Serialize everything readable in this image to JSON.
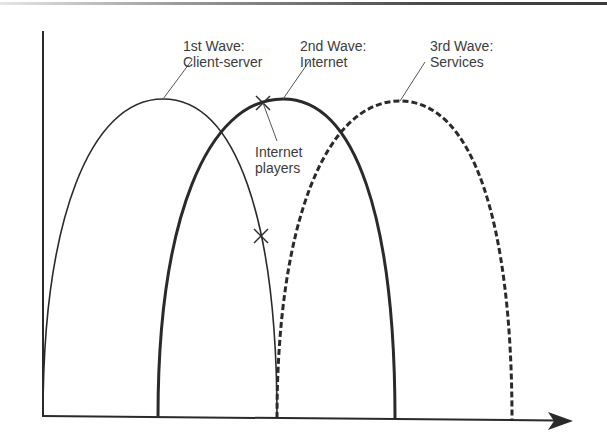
{
  "waves": [
    {
      "id": "wave-1",
      "line1": "1st Wave:",
      "line2": "Client-server",
      "style": "thin-solid",
      "start": 0,
      "peak": 1,
      "end": 2
    },
    {
      "id": "wave-2",
      "line1": "2nd Wave:",
      "line2": "Internet",
      "style": "thick-solid",
      "start": 1,
      "peak": 2,
      "end": 3
    },
    {
      "id": "wave-3",
      "line1": "3rd Wave:",
      "line2": "Services",
      "style": "thick-dashed",
      "start": 2,
      "peak": 3,
      "end": 4
    }
  ],
  "annotation": {
    "line1": "Internet",
    "line2": "players",
    "markers": 2
  },
  "colors": {
    "line": "#2a2a2a",
    "text": "#3b3b3b",
    "leader": "#555555"
  }
}
